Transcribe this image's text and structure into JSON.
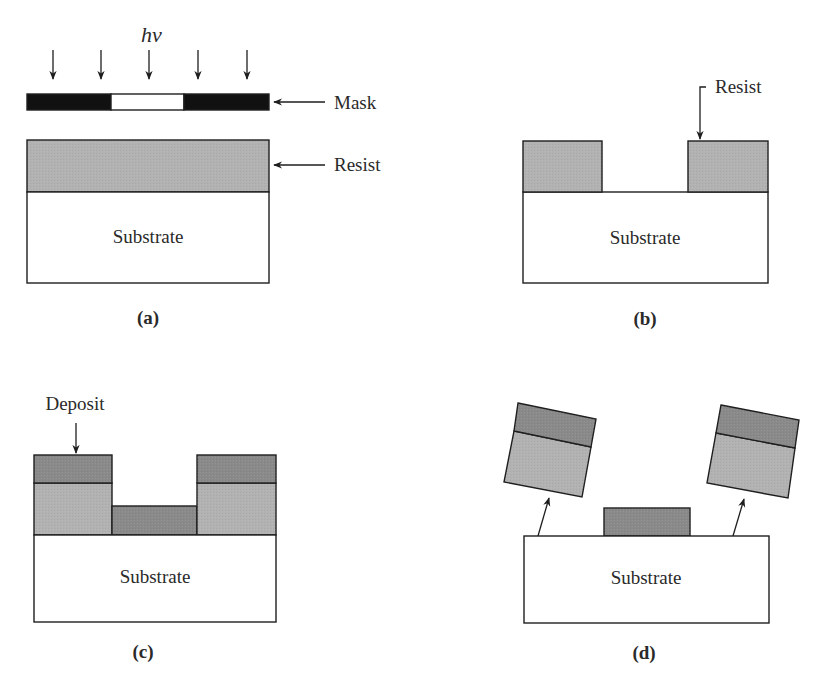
{
  "figure": {
    "colors": {
      "substrate": "#ffffff",
      "resist": "#b2b2b2",
      "deposit": "#8a8a8a",
      "mask_opaque": "#111111",
      "mask_clear": "#ffffff",
      "outline": "#1e1e1e"
    },
    "panels": [
      {
        "id": "a",
        "caption": "(a)",
        "substrate_label": "Substrate",
        "light_label": "hν",
        "mask_label": "Mask",
        "resist_label": "Resist",
        "light_arrows": 5
      },
      {
        "id": "b",
        "caption": "(b)",
        "substrate_label": "Substrate",
        "resist_label": "Resist"
      },
      {
        "id": "c",
        "caption": "(c)",
        "substrate_label": "Substrate",
        "deposit_label": "Deposit"
      },
      {
        "id": "d",
        "caption": "(d)",
        "substrate_label": "Substrate"
      }
    ]
  }
}
